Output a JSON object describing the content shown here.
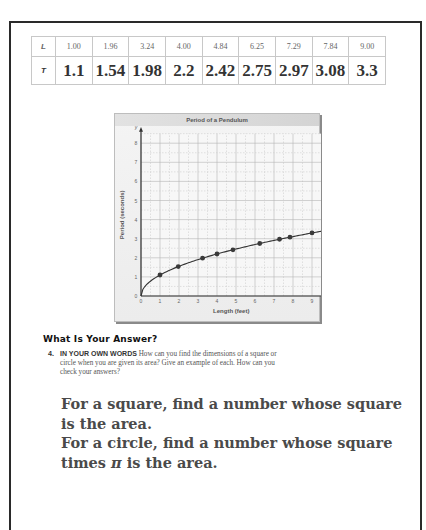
{
  "table": {
    "row_headers": [
      "L",
      "T"
    ],
    "L_values": [
      "1.00",
      "1.96",
      "3.24",
      "4.00",
      "4.84",
      "6.25",
      "7.29",
      "7.84",
      "9.00"
    ],
    "T_values": [
      "1.1",
      "1.54",
      "1.98",
      "2.2",
      "2.42",
      "2.75",
      "2.97",
      "3.08",
      "3.3"
    ]
  },
  "chart_data": {
    "type": "scatter",
    "title": "Period of a Pendulum",
    "xlabel": "Length (feet)",
    "ylabel": "Period (seconds)",
    "x": [
      1.0,
      1.96,
      3.24,
      4.0,
      4.84,
      6.25,
      7.29,
      7.84,
      9.0
    ],
    "y": [
      1.1,
      1.54,
      1.98,
      2.2,
      2.42,
      2.75,
      2.97,
      3.08,
      3.3
    ],
    "series": [
      {
        "name": "data points",
        "x": [
          1.0,
          1.96,
          3.24,
          4.0,
          4.84,
          6.25,
          7.29,
          7.84,
          9.0
        ],
        "values": [
          1.1,
          1.54,
          1.98,
          2.2,
          2.42,
          2.75,
          2.97,
          3.08,
          3.3
        ]
      },
      {
        "name": "curve T = 1.1*sqrt(L)",
        "type": "line"
      }
    ],
    "xlim": [
      0,
      9.5
    ],
    "ylim": [
      0,
      8.5
    ],
    "x_ticks": [
      "0",
      "1",
      "2",
      "3",
      "4",
      "5",
      "6",
      "7",
      "8",
      "9"
    ],
    "y_ticks": [
      "0",
      "1",
      "2",
      "3",
      "4",
      "5",
      "6",
      "7",
      "8"
    ],
    "x_axis_end_label": "x",
    "y_axis_end_label": "y",
    "grid": true,
    "legend": "none"
  },
  "answer_section": {
    "heading": "What Is Your Answer?",
    "question_number": "4.",
    "question_label": "IN YOUR OWN WORDS",
    "question_text_line1": " How can you find the dimensions of a square or",
    "question_text_line2": "circle when you are given its area? Give an example of each. How can you",
    "question_text_line3": "check your answers?",
    "answer_lines": [
      "For a square, find a number whose square",
      "is the area.",
      "For a circle, find a number whose square",
      "times",
      "π",
      "is the area."
    ]
  }
}
